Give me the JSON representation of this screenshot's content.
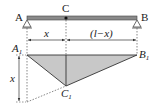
{
  "diagram": {
    "type": "beam influence diagram",
    "points": {
      "A": "A",
      "B": "B",
      "C": "C",
      "A1": "A",
      "A1_sub": "1",
      "B1": "B",
      "B1_sub": "1",
      "C1": "C",
      "C1_sub": "1"
    },
    "dimensions": {
      "left_segment": "x",
      "right_segment": "(l−x)",
      "vertical": "x"
    },
    "colors": {
      "beam": "#8a8a8a",
      "fill": "#c8c8c8",
      "line": "#333333"
    }
  }
}
